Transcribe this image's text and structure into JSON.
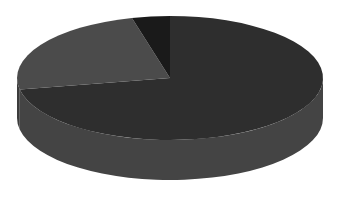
{
  "chart_data": {
    "type": "pie",
    "style": "3d",
    "title": "",
    "legend": {
      "visible": false,
      "entries": []
    },
    "data_labels": false,
    "slices": [
      {
        "name": "",
        "value": 72,
        "color": "#2e2e2e",
        "side_color": "#444444"
      },
      {
        "name": "",
        "value": 24,
        "color": "#4b4b4b",
        "side_color": "#3c3c3c"
      },
      {
        "name": "",
        "value": 4,
        "color": "#1a1a1a",
        "side_color": "#1a1a1a"
      }
    ],
    "start_angle_deg": -90,
    "geometry": {
      "cx": 170,
      "cy": 78,
      "rx": 153,
      "ry": 62,
      "depth": 40
    }
  }
}
